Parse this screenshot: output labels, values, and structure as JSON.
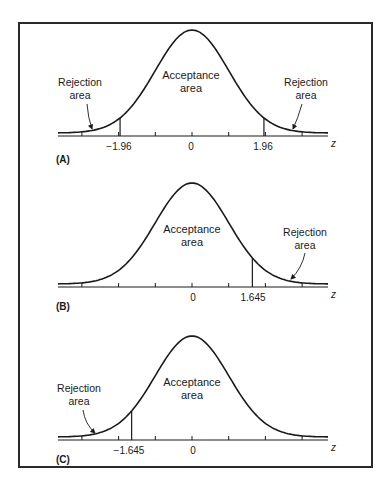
{
  "chart_data": [
    {
      "type": "area",
      "panel_label": "(A)",
      "description": "Two-tailed test, standard normal curve",
      "x_axis_label": "z",
      "tick_labels": [
        "-1.96",
        "0",
        "1.96"
      ],
      "critical_values": [
        -1.96,
        1.96
      ],
      "center": 0,
      "xlim": [
        -3.6,
        3.7
      ],
      "regions": [
        {
          "name": "Rejection area",
          "range": [
            -3.6,
            -1.96
          ],
          "side": "left"
        },
        {
          "name": "Acceptance area",
          "range": [
            -1.96,
            1.96
          ]
        },
        {
          "name": "Rejection area",
          "range": [
            1.96,
            3.7
          ],
          "side": "right"
        }
      ],
      "annotations": {
        "acceptance": [
          "Acceptance",
          "area"
        ],
        "rejection_left": [
          "Rejection",
          "area"
        ],
        "rejection_right": [
          "Rejection",
          "area"
        ]
      }
    },
    {
      "type": "area",
      "panel_label": "(B)",
      "description": "One-tailed (right) test, standard normal curve",
      "x_axis_label": "z",
      "tick_labels": [
        "0",
        "1.645"
      ],
      "critical_values": [
        1.645
      ],
      "center": 0,
      "xlim": [
        -3.6,
        3.7
      ],
      "regions": [
        {
          "name": "Acceptance area",
          "range": [
            -3.6,
            1.645
          ]
        },
        {
          "name": "Rejection area",
          "range": [
            1.645,
            3.7
          ],
          "side": "right"
        }
      ],
      "annotations": {
        "acceptance": [
          "Acceptance",
          "area"
        ],
        "rejection_right": [
          "Rejection",
          "area"
        ]
      }
    },
    {
      "type": "area",
      "panel_label": "(C)",
      "description": "One-tailed (left) test, standard normal curve",
      "x_axis_label": "z",
      "tick_labels": [
        "-1.645",
        "0"
      ],
      "critical_values": [
        -1.645
      ],
      "center": 0,
      "xlim": [
        -3.6,
        3.7
      ],
      "regions": [
        {
          "name": "Rejection area",
          "range": [
            -3.6,
            -1.645
          ],
          "side": "left"
        },
        {
          "name": "Acceptance area",
          "range": [
            -1.645,
            3.7
          ]
        }
      ],
      "annotations": {
        "acceptance": [
          "Acceptance",
          "area"
        ],
        "rejection_left": [
          "Rejection",
          "area"
        ]
      }
    }
  ],
  "panels": {
    "a": {
      "label": "(A)",
      "z": "z",
      "crit_left": "−1.96",
      "zero": "0",
      "crit_right": "1.96",
      "acc1": "Acceptance",
      "acc2": "area",
      "rejL1": "Rejection",
      "rejL2": "area",
      "rejR1": "Rejection",
      "rejR2": "area"
    },
    "b": {
      "label": "(B)",
      "z": "z",
      "zero": "0",
      "crit_right": "1.645",
      "acc1": "Acceptance",
      "acc2": "area",
      "rejR1": "Rejection",
      "rejR2": "area"
    },
    "c": {
      "label": "(C)",
      "z": "z",
      "crit_left": "−1.645",
      "zero": "0",
      "acc1": "Acceptance",
      "acc2": "area",
      "rejL1": "Rejection",
      "rejL2": "area"
    }
  },
  "colors": {
    "ink": "#1a1a1a",
    "frame": "#2a2a2a",
    "background": "#ffffff"
  }
}
